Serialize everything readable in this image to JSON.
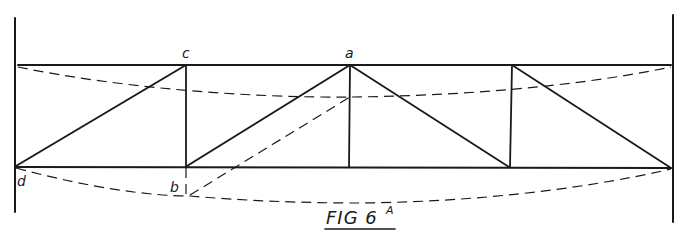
{
  "figure": {
    "caption": "FIG 6",
    "caption_superscript": "A"
  },
  "labels": {
    "a": "a",
    "b": "b",
    "c": "c",
    "d": "d"
  },
  "colors": {
    "ink": "#1a1a1a",
    "paper": "#ffffff"
  },
  "structure": {
    "type": "cantilever truss between two walls",
    "panels": 4,
    "deflected_shape": "dashed curves"
  }
}
